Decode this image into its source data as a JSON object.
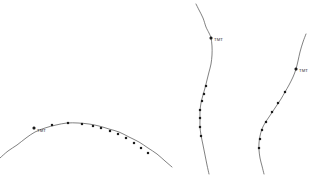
{
  "figure": {
    "title": "",
    "background_color": "#ffffff",
    "width": 310,
    "height": 176
  },
  "chart_data": {
    "type": "line",
    "title": "",
    "subtitle": "",
    "xlabel": "",
    "ylabel": "",
    "xlim": [
      0,
      310
    ],
    "ylim": [
      176,
      0
    ],
    "grid": false,
    "legend": false,
    "axes_visible": false,
    "tick_labels_x": [],
    "tick_labels_y": [],
    "line_color": "#4a4a4a",
    "marker_color": "#1c1c1c",
    "series": [
      {
        "name": "curve-left-arc",
        "label": "TMT",
        "label_x": 37,
        "label_y": 132,
        "anchor_x": 34,
        "anchor_y": 128,
        "x": [
          0,
          8,
          17,
          26,
          35,
          45,
          56,
          67,
          78,
          89,
          99,
          109,
          119,
          129,
          139,
          148,
          157,
          165,
          172
        ],
        "y": [
          158,
          151,
          145,
          138,
          132,
          128,
          125,
          123,
          123,
          124,
          126,
          129,
          132,
          137,
          142,
          148,
          154,
          161,
          167
        ],
        "markers_x": [
          34,
          52,
          68,
          82,
          93,
          101,
          110,
          118,
          126,
          134,
          141,
          148
        ],
        "markers_y": [
          128,
          125,
          123,
          124,
          126,
          128,
          131,
          134,
          138,
          143,
          148,
          153
        ]
      },
      {
        "name": "curve-middle-s",
        "label": "TMT",
        "label_x": 214,
        "label_y": 41,
        "anchor_x": 211,
        "anchor_y": 38,
        "x": [
          196,
          199,
          203,
          206,
          209,
          211,
          212,
          212,
          211,
          209,
          207,
          205,
          203,
          201,
          200,
          200,
          200,
          201,
          203,
          205,
          207,
          209
        ],
        "y": [
          4,
          10,
          18,
          27,
          33,
          38,
          46,
          55,
          64,
          72,
          80,
          88,
          95,
          103,
          111,
          119,
          127,
          135,
          145,
          155,
          165,
          174
        ],
        "markers_x": [
          211,
          206,
          204,
          202,
          200,
          200,
          200,
          201
        ],
        "markers_y": [
          38,
          86,
          94,
          101,
          110,
          118,
          127,
          136
        ]
      },
      {
        "name": "curve-right-s",
        "label": "TMT",
        "label_x": 299,
        "label_y": 72,
        "anchor_x": 296,
        "anchor_y": 69,
        "x": [
          306,
          303,
          300,
          298,
          296,
          293,
          289,
          285,
          281,
          277,
          273,
          269,
          265,
          262,
          260,
          259,
          259,
          260,
          262,
          264
        ],
        "y": [
          34,
          42,
          52,
          61,
          69,
          77,
          85,
          92,
          99,
          105,
          111,
          117,
          123,
          129,
          136,
          143,
          150,
          158,
          166,
          174
        ],
        "markers_x": [
          296,
          285,
          278,
          272,
          266,
          262,
          260,
          259
        ],
        "markers_y": [
          69,
          92,
          103,
          112,
          122,
          130,
          139,
          148
        ]
      }
    ],
    "annotations": [
      {
        "text": "TMT",
        "x": 37,
        "y": 132
      },
      {
        "text": "TMT",
        "x": 214,
        "y": 41
      },
      {
        "text": "TMT",
        "x": 299,
        "y": 72
      }
    ]
  }
}
